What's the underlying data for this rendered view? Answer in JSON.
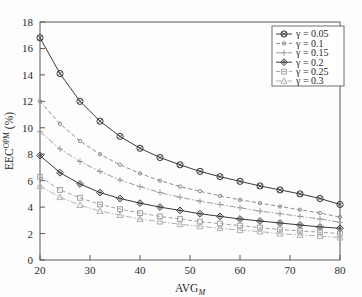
{
  "chart_data": {
    "type": "line",
    "title": "",
    "xlabel": "AVG_M",
    "xlabel_main": "AVG",
    "xlabel_sub": "M",
    "ylabel": "EEC^OPM (%)",
    "ylabel_main": "EEC",
    "ylabel_sup": "OPM",
    "ylabel_unit": " (%)",
    "xlim": [
      20,
      80
    ],
    "ylim": [
      0,
      18
    ],
    "xticks": [
      20,
      30,
      40,
      50,
      60,
      70,
      80
    ],
    "yticks": [
      0,
      2,
      4,
      6,
      8,
      10,
      12,
      14,
      16,
      18
    ],
    "grid": false,
    "legend_position": "top-right",
    "x": [
      20,
      24,
      28,
      32,
      36,
      40,
      44,
      48,
      52,
      56,
      60,
      64,
      68,
      72,
      76,
      80
    ],
    "series": [
      {
        "name": "γ = 0.05",
        "gamma": 0.05,
        "marker": "circle-cross",
        "dash": "solid",
        "color": "#3a3a3a",
        "values": [
          16.8,
          14.1,
          12.0,
          10.5,
          9.35,
          8.45,
          7.75,
          7.2,
          6.7,
          6.3,
          5.95,
          5.6,
          5.3,
          5.0,
          4.65,
          4.2
        ]
      },
      {
        "name": "γ = 0.1",
        "gamma": 0.1,
        "marker": "dot",
        "dash": "dashed",
        "color": "#8d8d8d",
        "values": [
          12.0,
          10.3,
          9.0,
          8.0,
          7.2,
          6.55,
          6.0,
          5.55,
          5.2,
          4.85,
          4.55,
          4.3,
          4.05,
          3.8,
          3.55,
          3.25
        ]
      },
      {
        "name": "γ = 0.15",
        "gamma": 0.15,
        "marker": "plus",
        "dash": "dashdot",
        "color": "#9b9b9b",
        "values": [
          9.7,
          8.4,
          7.45,
          6.7,
          6.05,
          5.55,
          5.1,
          4.75,
          4.45,
          4.2,
          3.95,
          3.7,
          3.5,
          3.3,
          3.1,
          2.85
        ]
      },
      {
        "name": "γ = 0.2",
        "gamma": 0.2,
        "marker": "diamond-cross",
        "dash": "solid",
        "color": "#3a3a3a",
        "values": [
          7.9,
          6.6,
          5.75,
          5.1,
          4.65,
          4.3,
          4.0,
          3.75,
          3.5,
          3.3,
          3.1,
          2.95,
          2.8,
          2.65,
          2.5,
          2.4
        ]
      },
      {
        "name": "γ = 0.25",
        "gamma": 0.25,
        "marker": "square",
        "dash": "dashed",
        "color": "#a2a2a2",
        "values": [
          6.3,
          5.3,
          4.7,
          4.2,
          3.85,
          3.55,
          3.3,
          3.1,
          2.9,
          2.75,
          2.6,
          2.45,
          2.3,
          2.2,
          2.1,
          2.0
        ]
      },
      {
        "name": "γ = 0.3",
        "gamma": 0.3,
        "marker": "triangle",
        "dash": "dashdot",
        "color": "#b0b0b0",
        "values": [
          5.6,
          4.75,
          4.15,
          3.7,
          3.4,
          3.1,
          2.9,
          2.7,
          2.55,
          2.4,
          2.25,
          2.15,
          2.0,
          1.9,
          1.8,
          1.7
        ]
      }
    ]
  },
  "legend": {
    "entries": [
      {
        "label": "γ = 0.05"
      },
      {
        "label": "γ = 0.1"
      },
      {
        "label": "γ = 0.15"
      },
      {
        "label": "γ = 0.2"
      },
      {
        "label": "γ = 0.25"
      },
      {
        "label": "γ = 0.3"
      }
    ]
  },
  "axes": {
    "x_tick_labels": [
      "20",
      "30",
      "40",
      "50",
      "60",
      "70",
      "80"
    ],
    "y_tick_labels": [
      "0",
      "2",
      "4",
      "6",
      "8",
      "10",
      "12",
      "14",
      "16",
      "18"
    ]
  }
}
